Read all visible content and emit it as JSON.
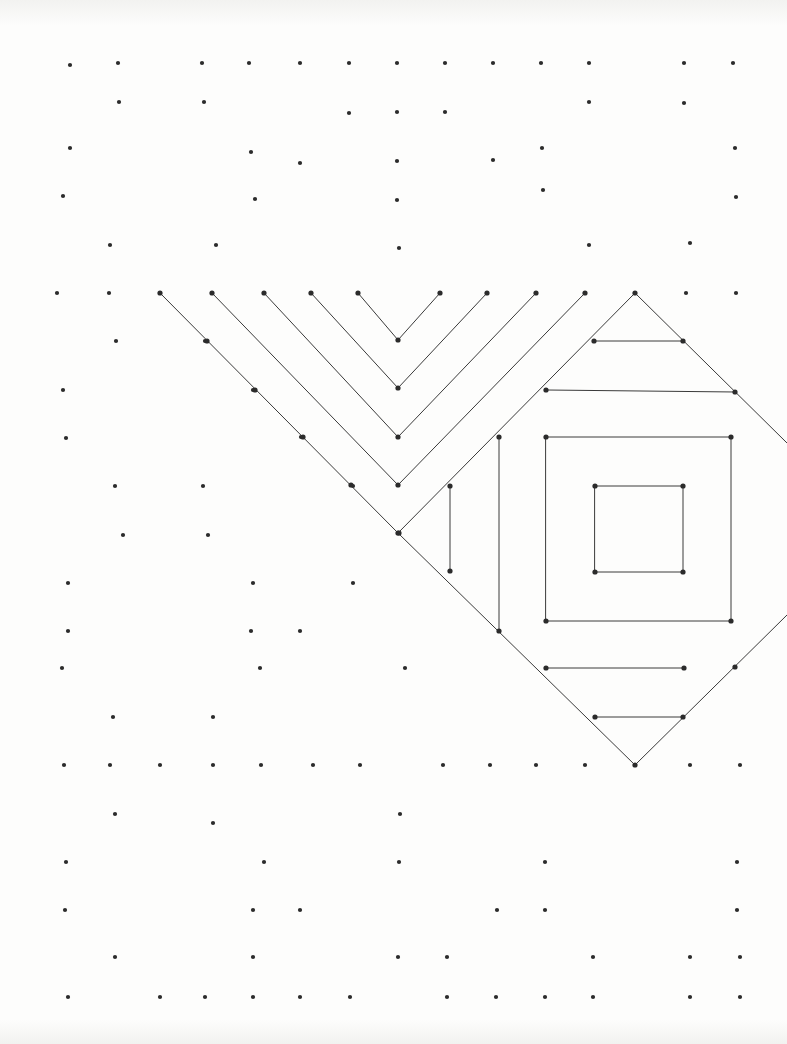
{
  "artwork": {
    "title": "Concentric diamond and chevron line drawing on dot grid paper",
    "medium": "pen on dot-grid paper",
    "canvas": {
      "width": 787,
      "height": 1044
    },
    "background_color": "#fdfdfc",
    "ink_color": "#3a3a3a",
    "dot_color": "#2b2b2b",
    "stroke_width": 1,
    "dot_radius": 2.1,
    "vertex_dot_radius": 2.6
  },
  "chart_data": {
    "type": "scatter",
    "xlabel": "",
    "ylabel": "",
    "xlim": [
      0,
      787
    ],
    "ylim": [
      0,
      1044
    ],
    "grid": false,
    "legend": "none",
    "grid_dots": [
      [
        70,
        65
      ],
      [
        118,
        63
      ],
      [
        202,
        63
      ],
      [
        249,
        63
      ],
      [
        300,
        63
      ],
      [
        349,
        63
      ],
      [
        397,
        63
      ],
      [
        445,
        63
      ],
      [
        493,
        63
      ],
      [
        541,
        63
      ],
      [
        589,
        63
      ],
      [
        684,
        63
      ],
      [
        733,
        63
      ],
      [
        119,
        102
      ],
      [
        204,
        102
      ],
      [
        349,
        113
      ],
      [
        397,
        112
      ],
      [
        445,
        112
      ],
      [
        589,
        102
      ],
      [
        684,
        103
      ],
      [
        70,
        148
      ],
      [
        251,
        152
      ],
      [
        300,
        163
      ],
      [
        397,
        161
      ],
      [
        493,
        160
      ],
      [
        542,
        148
      ],
      [
        735,
        148
      ],
      [
        63,
        196
      ],
      [
        255,
        199
      ],
      [
        397,
        200
      ],
      [
        543,
        190
      ],
      [
        736,
        197
      ],
      [
        110,
        245
      ],
      [
        216,
        245
      ],
      [
        399,
        248
      ],
      [
        589,
        245
      ],
      [
        690,
        243
      ],
      [
        57,
        293
      ],
      [
        109,
        293
      ],
      [
        686,
        293
      ],
      [
        736,
        293
      ],
      [
        116,
        341
      ],
      [
        205,
        341
      ],
      [
        63,
        390
      ],
      [
        253,
        390
      ],
      [
        66,
        438
      ],
      [
        301,
        437
      ],
      [
        115,
        486
      ],
      [
        203,
        486
      ],
      [
        353,
        486
      ],
      [
        123,
        535
      ],
      [
        208,
        535
      ],
      [
        68,
        583
      ],
      [
        253,
        583
      ],
      [
        353,
        583
      ],
      [
        68,
        631
      ],
      [
        251,
        631
      ],
      [
        300,
        631
      ],
      [
        62,
        668
      ],
      [
        260,
        668
      ],
      [
        405,
        668
      ],
      [
        113,
        717
      ],
      [
        213,
        717
      ],
      [
        64,
        765
      ],
      [
        110,
        765
      ],
      [
        160,
        765
      ],
      [
        213,
        765
      ],
      [
        261,
        765
      ],
      [
        313,
        765
      ],
      [
        360,
        765
      ],
      [
        443,
        765
      ],
      [
        490,
        765
      ],
      [
        536,
        765
      ],
      [
        585,
        765
      ],
      [
        690,
        765
      ],
      [
        740,
        765
      ],
      [
        115,
        814
      ],
      [
        213,
        823
      ],
      [
        400,
        814
      ],
      [
        66,
        862
      ],
      [
        264,
        862
      ],
      [
        399,
        862
      ],
      [
        545,
        862
      ],
      [
        737,
        862
      ],
      [
        65,
        910
      ],
      [
        253,
        910
      ],
      [
        300,
        910
      ],
      [
        497,
        910
      ],
      [
        545,
        910
      ],
      [
        737,
        910
      ],
      [
        115,
        957
      ],
      [
        253,
        957
      ],
      [
        398,
        957
      ],
      [
        447,
        957
      ],
      [
        593,
        957
      ],
      [
        690,
        957
      ],
      [
        740,
        957
      ],
      [
        68,
        997
      ],
      [
        160,
        997
      ],
      [
        205,
        997
      ],
      [
        253,
        997
      ],
      [
        300,
        997
      ],
      [
        350,
        997
      ],
      [
        447,
        997
      ],
      [
        496,
        997
      ],
      [
        545,
        997
      ],
      [
        593,
        997
      ],
      [
        690,
        997
      ],
      [
        740,
        997
      ]
    ],
    "vertices": [
      [
        160,
        293
      ],
      [
        212,
        293
      ],
      [
        264,
        293
      ],
      [
        311,
        293
      ],
      [
        358,
        293
      ],
      [
        440,
        293
      ],
      [
        487,
        293
      ],
      [
        536,
        293
      ],
      [
        585,
        293
      ],
      [
        635,
        293
      ],
      [
        398,
        340
      ],
      [
        398,
        388
      ],
      [
        398,
        437
      ],
      [
        398,
        485
      ],
      [
        398,
        533
      ],
      [
        207,
        341
      ],
      [
        255,
        390
      ],
      [
        303,
        437
      ],
      [
        351,
        485
      ],
      [
        399,
        533
      ],
      [
        594,
        341
      ],
      [
        683,
        341
      ],
      [
        546,
        390
      ],
      [
        735,
        392
      ],
      [
        546,
        437
      ],
      [
        731,
        437
      ],
      [
        546,
        621
      ],
      [
        731,
        621
      ],
      [
        595,
        486
      ],
      [
        683,
        486
      ],
      [
        595,
        572
      ],
      [
        683,
        572
      ],
      [
        450,
        486
      ],
      [
        450,
        571
      ],
      [
        499,
        437
      ],
      [
        499,
        631
      ],
      [
        546,
        668
      ],
      [
        684,
        668
      ],
      [
        595,
        717
      ],
      [
        683,
        717
      ],
      [
        635,
        765
      ],
      [
        735,
        667
      ]
    ],
    "shapes": [
      {
        "name": "chevron-1-outer",
        "kind": "polyline",
        "points": [
          [
            160,
            293
          ],
          [
            398,
            533
          ],
          [
            635,
            293
          ]
        ]
      },
      {
        "name": "chevron-2",
        "kind": "polyline",
        "points": [
          [
            212,
            293
          ],
          [
            398,
            485
          ],
          [
            585,
            293
          ]
        ]
      },
      {
        "name": "chevron-3",
        "kind": "polyline",
        "points": [
          [
            264,
            293
          ],
          [
            398,
            437
          ],
          [
            536,
            293
          ]
        ]
      },
      {
        "name": "chevron-4",
        "kind": "polyline",
        "points": [
          [
            311,
            293
          ],
          [
            398,
            388
          ],
          [
            487,
            293
          ]
        ]
      },
      {
        "name": "chevron-5-inner",
        "kind": "polyline",
        "points": [
          [
            358,
            293
          ],
          [
            398,
            340
          ],
          [
            440,
            293
          ]
        ]
      },
      {
        "name": "diamond-lower-left-arm",
        "kind": "polyline",
        "points": [
          [
            398,
            533
          ],
          [
            635,
            765
          ]
        ]
      },
      {
        "name": "diamond-lower-right-arm",
        "kind": "polyline",
        "points": [
          [
            635,
            765
          ],
          [
            787,
            615
          ]
        ]
      },
      {
        "name": "diamond-upper-right-arm",
        "kind": "polyline",
        "points": [
          [
            635,
            293
          ],
          [
            787,
            443
          ]
        ]
      },
      {
        "name": "triangle-top-chord-short",
        "kind": "line",
        "points": [
          [
            594,
            341
          ],
          [
            683,
            341
          ]
        ]
      },
      {
        "name": "triangle-top-chord-long",
        "kind": "line",
        "points": [
          [
            546,
            390
          ],
          [
            735,
            392
          ]
        ]
      },
      {
        "name": "square-outer",
        "kind": "rect",
        "points": [
          [
            546,
            437
          ],
          [
            731,
            437
          ],
          [
            731,
            621
          ],
          [
            546,
            621
          ]
        ]
      },
      {
        "name": "square-inner",
        "kind": "rect",
        "points": [
          [
            595,
            486
          ],
          [
            683,
            486
          ],
          [
            683,
            572
          ],
          [
            595,
            572
          ]
        ]
      },
      {
        "name": "vertical-chord-left",
        "kind": "line",
        "points": [
          [
            450,
            486
          ],
          [
            450,
            571
          ]
        ]
      },
      {
        "name": "vertical-chord-right",
        "kind": "line",
        "points": [
          [
            499,
            437
          ],
          [
            499,
            631
          ]
        ]
      },
      {
        "name": "triangle-bottom-chord-long",
        "kind": "line",
        "points": [
          [
            546,
            668
          ],
          [
            684,
            668
          ]
        ]
      },
      {
        "name": "triangle-bottom-chord-short",
        "kind": "line",
        "points": [
          [
            595,
            717
          ],
          [
            683,
            717
          ]
        ]
      }
    ]
  }
}
